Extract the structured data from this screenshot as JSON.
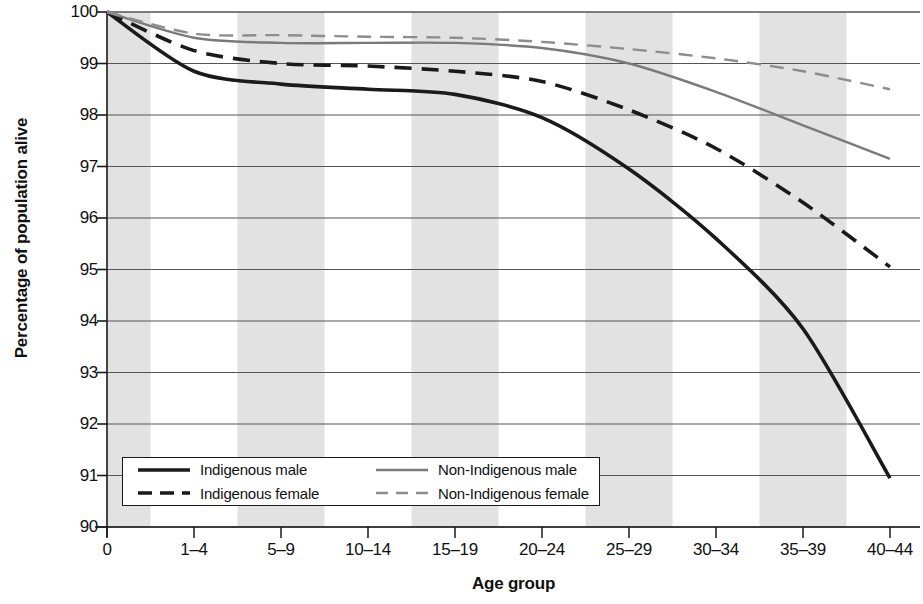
{
  "chart_data": {
    "type": "line",
    "title": "",
    "xlabel": "Age group",
    "ylabel": "Percentage of population alive",
    "categories": [
      "0",
      "1–4",
      "5–9",
      "10–14",
      "15–19",
      "20–24",
      "25–29",
      "30–34",
      "35–39",
      "40–44"
    ],
    "ylim": [
      90,
      100
    ],
    "yticks": [
      "90",
      "91",
      "92",
      "93",
      "94",
      "95",
      "96",
      "97",
      "98",
      "99",
      "100"
    ],
    "grid": "horizontal",
    "legend_position": "lower-left",
    "banding": "alternating vertical grey bands on 0, 5–9, 15–19, 25–29, 35–39",
    "series": [
      {
        "name": "Indigenous male",
        "style": "solid",
        "color": "#1a1a1a",
        "values": [
          100.0,
          98.85,
          98.6,
          98.5,
          98.4,
          97.95,
          96.95,
          95.6,
          93.85,
          90.95
        ]
      },
      {
        "name": "Indigenous female",
        "style": "dashed",
        "color": "#1a1a1a",
        "values": [
          100.0,
          99.25,
          99.0,
          98.95,
          98.85,
          98.65,
          98.1,
          97.35,
          96.3,
          95.05
        ]
      },
      {
        "name": "Non-Indigenous male",
        "style": "solid",
        "color": "#7a7a7a",
        "values": [
          100.0,
          99.5,
          99.4,
          99.4,
          99.4,
          99.3,
          99.0,
          98.45,
          97.8,
          97.15
        ]
      },
      {
        "name": "Non-Indigenous female",
        "style": "dashed",
        "color": "#8d8d8d",
        "values": [
          100.0,
          99.58,
          99.55,
          99.52,
          99.5,
          99.42,
          99.28,
          99.1,
          98.85,
          98.5
        ]
      }
    ]
  },
  "colors": {
    "band": "#e2e2e2",
    "axis": "#1a1a1a",
    "grid": "#555555",
    "indigenous": "#1a1a1a",
    "non_indigenous": "#7a7a7a"
  }
}
